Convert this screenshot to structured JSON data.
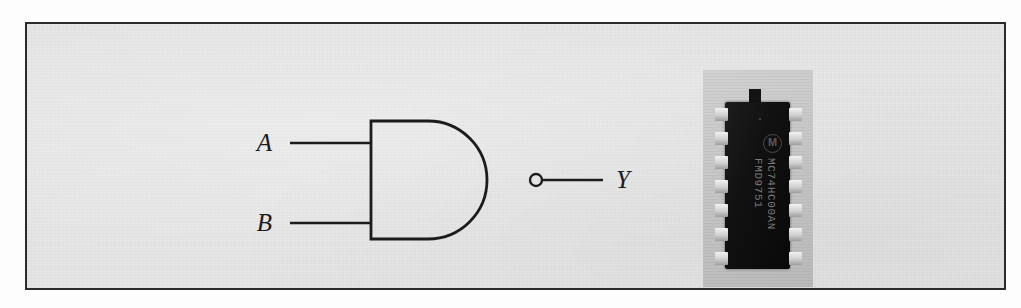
{
  "figure": {
    "kind": "logic-gate-figure",
    "border_color": "#2b2b2b",
    "background_color": "#e4e4e4"
  },
  "gate": {
    "type": "NAND",
    "shape": "distinctive-shape-and-with-bubble",
    "line_color": "#1c1c1c",
    "inputs": [
      {
        "label": "A",
        "name": "input-a"
      },
      {
        "label": "B",
        "name": "input-b"
      }
    ],
    "output": {
      "label": "Y",
      "name": "output-y"
    },
    "bubble": {
      "name": "inversion-bubble",
      "radius": 6
    }
  },
  "ic": {
    "package": "DIP-14",
    "pin_count_per_side": 7,
    "body_color": "#111111",
    "pin_color": "#cfcfcf",
    "plate_color": "#c4c4c4",
    "manufacturer_logo": "motorola-logo",
    "logo_glyph": "M",
    "marking_line_1": "MC74HC00AN",
    "marking_line_2": "FMD9751"
  }
}
